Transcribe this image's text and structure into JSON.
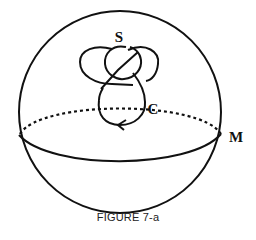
{
  "figure": {
    "caption": "FIGURE 7-a",
    "labels": {
      "sphere_surface": "S",
      "curve": "C",
      "manifold": "M"
    },
    "colors": {
      "stroke": "#111111",
      "background": "#ffffff"
    },
    "elements": [
      "sphere-outline",
      "equator-front-solid",
      "equator-back-dotted",
      "knot-S",
      "loop-C-with-arrow"
    ]
  }
}
